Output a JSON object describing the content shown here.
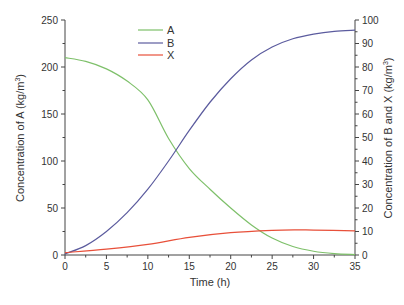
{
  "chart_data": {
    "type": "line",
    "title": "",
    "xlabel": "Time (h)",
    "ylabel_left": "Concentration of A (kg/m3)",
    "ylabel_right": "Concentration of B and X (kg/m3)",
    "xlim": [
      0,
      35
    ],
    "ylim_left": [
      0,
      250
    ],
    "ylim_right": [
      0,
      100
    ],
    "x_ticks": [
      0,
      5,
      10,
      15,
      20,
      25,
      30,
      35
    ],
    "y_ticks_left": [
      0,
      50,
      100,
      150,
      200,
      250
    ],
    "y_ticks_right": [
      0,
      10,
      20,
      30,
      40,
      50,
      60,
      70,
      80,
      90,
      100
    ],
    "grid": false,
    "legend_position": "upper-center-left",
    "series": [
      {
        "name": "A",
        "axis": "left",
        "color": "#7ec06a",
        "x": [
          0,
          2.5,
          5,
          7.5,
          10,
          12.5,
          15,
          17.5,
          20,
          22.5,
          25,
          27.5,
          30,
          32.5,
          35
        ],
        "values": [
          210,
          206,
          198,
          185,
          165,
          124,
          92,
          70,
          50,
          32,
          18,
          9,
          4,
          1.5,
          0.5
        ]
      },
      {
        "name": "B",
        "axis": "right",
        "color": "#5b5b9e",
        "x": [
          0,
          2.5,
          5,
          7.5,
          10,
          12.5,
          15,
          17.5,
          20,
          22.5,
          25,
          27.5,
          30,
          32.5,
          35
        ],
        "values": [
          0.5,
          4,
          10,
          18,
          28,
          40,
          53,
          65,
          75,
          83,
          88.5,
          92,
          94,
          95.2,
          95.7
        ]
      },
      {
        "name": "X",
        "axis": "right",
        "color": "#e8503a",
        "x": [
          0,
          5,
          10,
          15,
          20,
          25,
          28,
          30,
          35
        ],
        "values": [
          1,
          2.5,
          4.5,
          7.5,
          9.5,
          10.5,
          10.7,
          10.6,
          10.3
        ]
      }
    ]
  },
  "legend": {
    "a": "A",
    "b": "B",
    "x": "X"
  },
  "labels": {
    "xlabel": "Time (h)",
    "ylabel_left_main": "Concentration of A (kg/m",
    "ylabel_right_main": "Concentration of B and X (kg/m",
    "superscript": "3",
    "close_paren": ")"
  }
}
